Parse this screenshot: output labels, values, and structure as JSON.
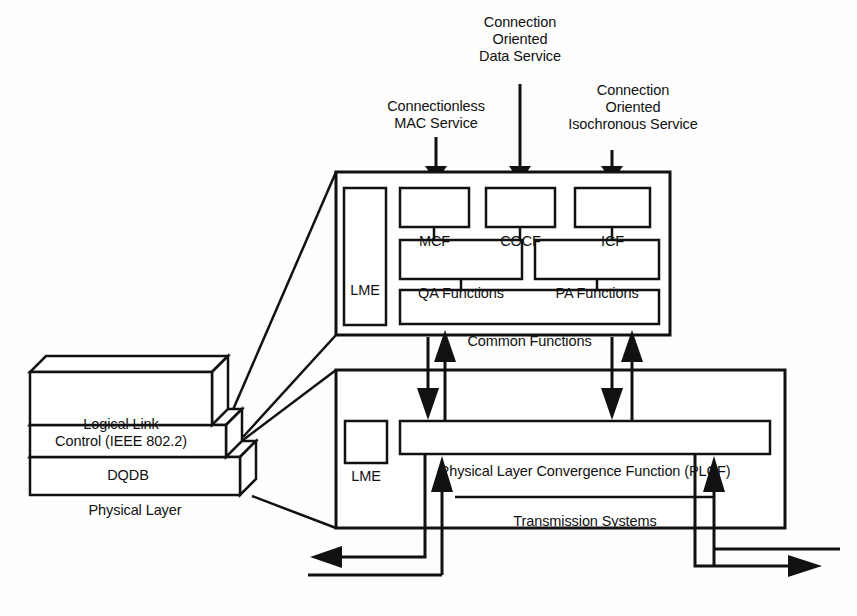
{
  "diagram": {
    "stroke_color": "#111111",
    "fill_color": "#ffffff",
    "background": "#fefefe"
  },
  "service_labels": [
    {
      "id": "connectionless-mac-service",
      "text": "Connectionless\nMAC Service",
      "x": 368,
      "y": 98,
      "width": 136,
      "arrow_x": 436,
      "arrow_top": 137,
      "arrow_tip": 180
    },
    {
      "id": "connection-oriented-data-service",
      "text": "Connection\nOriented\nData Service",
      "x": 458,
      "y": 14,
      "width": 124,
      "arrow_x": 520,
      "arrow_top": 84,
      "arrow_tip": 180
    },
    {
      "id": "connection-oriented-isochronous-service",
      "text": "Connection\nOriented\nIsochronous Service",
      "x": 540,
      "y": 82,
      "width": 186,
      "arrow_x": 612,
      "arrow_top": 150,
      "arrow_tip": 180
    }
  ],
  "upper_block": {
    "name": "dqdb-layer-block",
    "outer": {
      "x": 336,
      "y": 172,
      "w": 334,
      "h": 163
    },
    "lme": {
      "label": "LME",
      "x": 344,
      "y": 188,
      "w": 42,
      "h": 137
    },
    "function_boxes": [
      {
        "id": "mcf",
        "label": "MCF",
        "x": 400,
        "y": 188,
        "w": 69,
        "h": 39
      },
      {
        "id": "cocf",
        "label": "COCF",
        "x": 486,
        "y": 188,
        "w": 69,
        "h": 39
      },
      {
        "id": "icf",
        "label": "ICF",
        "x": 575,
        "y": 188,
        "w": 75,
        "h": 39
      }
    ],
    "access_boxes": [
      {
        "id": "qa-functions",
        "label": "QA Functions",
        "x": 400,
        "y": 240,
        "w": 122,
        "h": 39
      },
      {
        "id": "pa-functions",
        "label": "PA Functions",
        "x": 535,
        "y": 240,
        "w": 124,
        "h": 39
      }
    ],
    "common": {
      "id": "common-functions",
      "label": "Common Functions",
      "x": 400,
      "y": 290,
      "w": 259,
      "h": 34
    }
  },
  "lower_block": {
    "name": "physical-layer-block",
    "outer": {
      "x": 336,
      "y": 370,
      "w": 449,
      "h": 158
    },
    "lme": {
      "label": "LME",
      "x": 345,
      "y": 421,
      "w": 42,
      "h": 42
    },
    "plcf": {
      "id": "plcf",
      "label": "Physical Layer Convergence Function (PLCF)",
      "x": 400,
      "y": 421,
      "w": 370,
      "h": 33
    },
    "transmission": {
      "id": "transmission-systems",
      "label": "Transmission Systems",
      "x": 455,
      "y": 476,
      "w": 260
    }
  },
  "protocol_stack": {
    "name": "protocol-stack",
    "layers": [
      {
        "id": "logical-link-control",
        "label": "Logical Link\nControl (IEEE 802.2)",
        "x": 30,
        "y": 372,
        "w": 182,
        "h": 53
      },
      {
        "id": "dqdb",
        "label": "DQDB",
        "x": 30,
        "y": 425,
        "w": 196,
        "h": 32
      },
      {
        "id": "physical-layer",
        "label": "Physical Layer",
        "x": 30,
        "y": 457,
        "w": 210,
        "h": 38
      }
    ],
    "depth": 16
  },
  "internal_arrows": [
    {
      "id": "dqdb-to-plcf-left",
      "direction": "down",
      "x": 428,
      "y_from": 337,
      "y_to": 420
    },
    {
      "id": "plcf-to-dqdb-left",
      "direction": "up",
      "x": 445,
      "y_from": 420,
      "y_to": 337
    },
    {
      "id": "dqdb-to-plcf-right",
      "direction": "down",
      "x": 612,
      "y_from": 337,
      "y_to": 420
    },
    {
      "id": "plcf-to-dqdb-right",
      "direction": "up",
      "x": 632,
      "y_from": 420,
      "y_to": 337
    }
  ],
  "transmission_arrows": [
    {
      "id": "plcf-receive-left",
      "direction": "up",
      "x": 442,
      "y_from": 500,
      "y_to": 456
    },
    {
      "id": "plcf-receive-right",
      "direction": "up",
      "x": 714,
      "y_from": 500,
      "y_to": 456
    }
  ],
  "bus_arrows": [
    {
      "id": "bus-outbound-left",
      "direction": "left",
      "y": 557,
      "x_from": 390,
      "x_to": 318
    },
    {
      "id": "bus-outbound-right",
      "direction": "right",
      "y": 566,
      "x_from": 712,
      "x_to": 818
    }
  ]
}
